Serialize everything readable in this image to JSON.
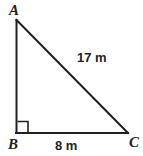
{
  "figure": {
    "kind": "right-triangle-diagram",
    "background_color": "#ffffff",
    "stroke_color": "#231f20",
    "stroke_width": 2,
    "width": 143,
    "height": 156
  },
  "vertices": [
    {
      "id": "A",
      "label": "A",
      "x": 16,
      "y": 20,
      "name": "vertex-a"
    },
    {
      "id": "B",
      "label": "B",
      "x": 16,
      "y": 133,
      "name": "vertex-b"
    },
    {
      "id": "C",
      "label": "C",
      "x": 128,
      "y": 133,
      "name": "vertex-c"
    }
  ],
  "sides": [
    {
      "id": "AB",
      "from": "A",
      "to": "B",
      "label": "",
      "name": "side-ab"
    },
    {
      "id": "BC",
      "from": "B",
      "to": "C",
      "label": "8 m",
      "name": "side-bc"
    },
    {
      "id": "AC",
      "from": "A",
      "to": "C",
      "label": "17 m",
      "name": "side-ac-hypotenuse"
    }
  ],
  "labels": {
    "vertex_a": "A",
    "vertex_b": "B",
    "vertex_c": "C",
    "hypotenuse": "17 m",
    "base": "8 m"
  },
  "right_angle": {
    "at_vertex": "B",
    "marker": "square",
    "size": 11,
    "x": 17,
    "y": 122
  },
  "measurements": {
    "hypotenuse_value": 17,
    "hypotenuse_unit": "m",
    "base_value": 8,
    "base_unit": "m"
  }
}
